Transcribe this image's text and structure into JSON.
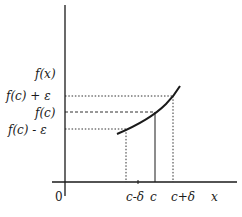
{
  "diagram": {
    "y_axis_label": "f(x)",
    "x_axis_label": "x",
    "origin_label": "0",
    "y_labels": {
      "upper": "f(c) + ε",
      "middle": "f(c)",
      "lower": "f(c) - ε"
    },
    "x_labels": {
      "left": "c-δ",
      "center": "c",
      "right": "c+δ"
    },
    "colors": {
      "ink": "#1a1a1a",
      "background": "#ffffff"
    }
  }
}
